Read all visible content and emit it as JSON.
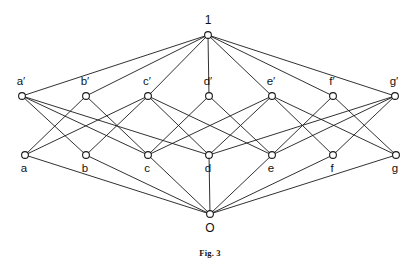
{
  "figure": {
    "caption": "Fig. 3",
    "caption_y": 248,
    "width": 420,
    "height": 268,
    "background_color": "#ffffff",
    "line_color": "#1a1a1a",
    "node_fill_color": "#ffffff",
    "node_radius": 3.4
  },
  "chart_data": {
    "type": "diagram",
    "diagram_kind": "hasse-lattice",
    "title": "Fig. 3",
    "nodes": [
      {
        "id": "1",
        "label": "1",
        "x": 208,
        "y": 35,
        "level": "top",
        "label_dx": 0,
        "label_dy": -14
      },
      {
        "id": "ap",
        "label": "a′",
        "x": 22,
        "y": 96,
        "level": "upper",
        "label_dx": -1,
        "label_dy": -14
      },
      {
        "id": "bp",
        "label": "b′",
        "x": 86,
        "y": 96,
        "level": "upper",
        "label_dx": -1,
        "label_dy": -14
      },
      {
        "id": "cp",
        "label": "c′",
        "x": 148,
        "y": 96,
        "level": "upper",
        "label_dx": -1,
        "label_dy": -14
      },
      {
        "id": "dp",
        "label": "d′",
        "x": 209,
        "y": 96,
        "level": "upper",
        "label_dx": -1,
        "label_dy": -14
      },
      {
        "id": "ep",
        "label": "e′",
        "x": 272,
        "y": 96,
        "level": "upper",
        "label_dx": -1,
        "label_dy": -14
      },
      {
        "id": "fp",
        "label": "f′",
        "x": 333,
        "y": 96,
        "level": "upper",
        "label_dx": -1,
        "label_dy": -14
      },
      {
        "id": "gp",
        "label": "g′",
        "x": 395,
        "y": 96,
        "level": "upper",
        "label_dx": -1,
        "label_dy": -14
      },
      {
        "id": "a",
        "label": "a",
        "x": 25,
        "y": 155,
        "level": "lower",
        "label_dx": -1,
        "label_dy": 14
      },
      {
        "id": "b",
        "label": "b",
        "x": 86,
        "y": 155,
        "level": "lower",
        "label_dx": -1,
        "label_dy": 14
      },
      {
        "id": "c",
        "label": "c",
        "x": 148,
        "y": 155,
        "level": "lower",
        "label_dx": -1,
        "label_dy": 14
      },
      {
        "id": "d",
        "label": "d",
        "x": 209,
        "y": 155,
        "level": "lower",
        "label_dx": -1,
        "label_dy": 14
      },
      {
        "id": "e",
        "label": "e",
        "x": 272,
        "y": 155,
        "level": "lower",
        "label_dx": -1,
        "label_dy": 14
      },
      {
        "id": "f",
        "label": "f",
        "x": 333,
        "y": 155,
        "level": "lower",
        "label_dx": -1,
        "label_dy": 14
      },
      {
        "id": "g",
        "label": "g",
        "x": 396,
        "y": 155,
        "level": "lower",
        "label_dx": -1,
        "label_dy": 14
      },
      {
        "id": "O",
        "label": "O",
        "x": 210,
        "y": 214,
        "level": "bottom",
        "label_dx": 0,
        "label_dy": 15
      }
    ],
    "edges": [
      {
        "from": "1",
        "to": "ap"
      },
      {
        "from": "1",
        "to": "bp"
      },
      {
        "from": "1",
        "to": "cp"
      },
      {
        "from": "1",
        "to": "dp"
      },
      {
        "from": "1",
        "to": "ep"
      },
      {
        "from": "1",
        "to": "fp"
      },
      {
        "from": "1",
        "to": "gp"
      },
      {
        "from": "ap",
        "to": "b"
      },
      {
        "from": "ap",
        "to": "c"
      },
      {
        "from": "ap",
        "to": "d"
      },
      {
        "from": "bp",
        "to": "a"
      },
      {
        "from": "bp",
        "to": "c"
      },
      {
        "from": "cp",
        "to": "a"
      },
      {
        "from": "cp",
        "to": "b"
      },
      {
        "from": "cp",
        "to": "d"
      },
      {
        "from": "cp",
        "to": "e"
      },
      {
        "from": "dp",
        "to": "c"
      },
      {
        "from": "dp",
        "to": "e"
      },
      {
        "from": "ep",
        "to": "c"
      },
      {
        "from": "ep",
        "to": "d"
      },
      {
        "from": "ep",
        "to": "f"
      },
      {
        "from": "ep",
        "to": "g"
      },
      {
        "from": "fp",
        "to": "e"
      },
      {
        "from": "fp",
        "to": "g"
      },
      {
        "from": "gp",
        "to": "d"
      },
      {
        "from": "gp",
        "to": "e"
      },
      {
        "from": "gp",
        "to": "f"
      },
      {
        "from": "a",
        "to": "O"
      },
      {
        "from": "b",
        "to": "O"
      },
      {
        "from": "c",
        "to": "O"
      },
      {
        "from": "d",
        "to": "O"
      },
      {
        "from": "e",
        "to": "O"
      },
      {
        "from": "f",
        "to": "O"
      },
      {
        "from": "g",
        "to": "O"
      }
    ]
  }
}
